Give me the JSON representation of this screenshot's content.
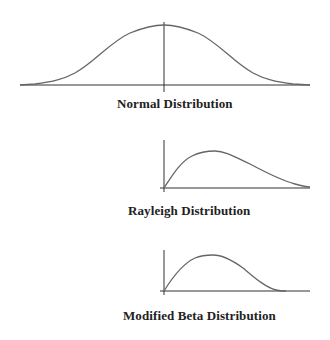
{
  "figure": {
    "background": "#ffffff",
    "line_color": "#555555",
    "axis_color": "#222222",
    "panels": [
      {
        "id": "normal",
        "title": "Normal Distribution",
        "shape": "symmetric bell curve",
        "axes": "horizontal axis with vertical axis at center"
      },
      {
        "id": "rayleigh",
        "title": "Rayleigh Distribution",
        "shape": "right-skewed, starts at origin, long right tail",
        "axes": "vertical axis at left origin"
      },
      {
        "id": "beta",
        "title": "Modified Beta Distribution",
        "shape": "right-skewed hump, starts at origin, returns to zero on bounded range",
        "axes": "vertical axis at left origin"
      }
    ]
  }
}
